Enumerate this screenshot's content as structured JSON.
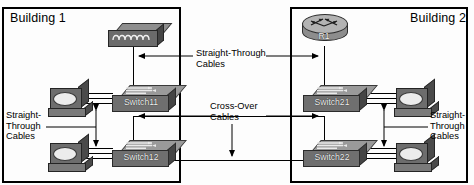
{
  "diagram": {
    "buildings": [
      {
        "id": "building1",
        "label": "Building 1"
      },
      {
        "id": "building2",
        "label": "Building 2"
      }
    ],
    "devices": [
      {
        "id": "hub1",
        "type": "hub",
        "label": ""
      },
      {
        "id": "router1",
        "type": "router",
        "label": "R1"
      },
      {
        "id": "sw11",
        "type": "switch",
        "label": "Switch11"
      },
      {
        "id": "sw12",
        "type": "switch",
        "label": "Switch12"
      },
      {
        "id": "sw21",
        "type": "switch",
        "label": "Switch21"
      },
      {
        "id": "sw22",
        "type": "switch",
        "label": "Switch22"
      },
      {
        "id": "pc11",
        "type": "workstation",
        "label": ""
      },
      {
        "id": "pc12",
        "type": "workstation",
        "label": ""
      },
      {
        "id": "pc21",
        "type": "workstation",
        "label": ""
      },
      {
        "id": "pc22",
        "type": "workstation",
        "label": ""
      }
    ],
    "callouts": [
      {
        "id": "callout-left",
        "text": "Straight-\nThrough\nCables"
      },
      {
        "id": "callout-center-top",
        "text": "Straight-Through\nCables"
      },
      {
        "id": "callout-center-mid",
        "text": "Cross-Over\nCables"
      },
      {
        "id": "callout-right",
        "text": "Straight-\nThrough\nCables"
      }
    ],
    "colors": {
      "line": "#000000",
      "device_light": "#b3b3b3",
      "device_mid": "#8d8d8d",
      "device_dark": "#454545",
      "background": "#ffffff"
    }
  }
}
